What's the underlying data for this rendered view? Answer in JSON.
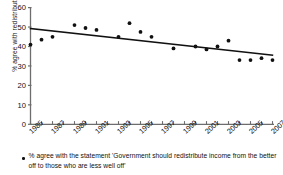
{
  "chart_data": {
    "type": "scatter",
    "title": "",
    "xlabel": "",
    "ylabel": "% agree with redistribution",
    "xlim": [
      1985,
      2007
    ],
    "ylim": [
      0,
      60
    ],
    "yticks": [
      0,
      10,
      20,
      30,
      40,
      50,
      60
    ],
    "xticks": [
      1985,
      1987,
      1989,
      1991,
      1993,
      1995,
      1997,
      1999,
      2001,
      2003,
      2005,
      2007
    ],
    "xtick_labels": [
      "1985",
      "1987",
      "1989",
      "1991",
      "1993",
      "1995",
      "1997",
      "1999",
      "2001",
      "2003",
      "2005",
      "2007"
    ],
    "grid": false,
    "legend": "below",
    "marker_color": "#111111",
    "trendline_color": "#111111",
    "x": [
      1985,
      1986,
      1987,
      1989,
      1990,
      1991,
      1993,
      1994,
      1995,
      1996,
      1998,
      2000,
      2001,
      2002,
      2003,
      2004,
      2005,
      2006,
      2007
    ],
    "values": [
      41,
      43.5,
      45,
      51,
      49.5,
      48.5,
      45,
      52,
      47.5,
      45,
      39,
      40,
      38.5,
      40,
      43,
      33,
      33,
      34,
      33
    ],
    "series": [
      {
        "name": "% agree with redistribution",
        "x": [
          1985,
          1986,
          1987,
          1989,
          1990,
          1991,
          1993,
          1994,
          1995,
          1996,
          1998,
          2000,
          2001,
          2002,
          2003,
          2004,
          2005,
          2006,
          2007
        ],
        "values": [
          41,
          43.5,
          45,
          51,
          49.5,
          48.5,
          45,
          52,
          47.5,
          45,
          39,
          40,
          38.5,
          40,
          43,
          33,
          33,
          34,
          33
        ]
      },
      {
        "name": "linear trend",
        "type": "line",
        "x": [
          1985,
          2007
        ],
        "values": [
          49.2,
          35.6
        ]
      }
    ],
    "annotations": []
  },
  "caption": {
    "marker": "scatter-dot",
    "text": "% agree with the statement 'Government should redistribute income from the better off to those who are less well off'"
  },
  "axes": {
    "y_axis_label": "% agree with redistribution"
  }
}
